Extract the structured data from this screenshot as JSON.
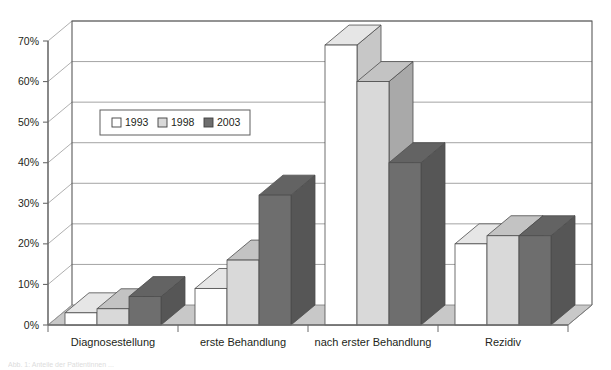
{
  "chart_data": {
    "type": "bar",
    "title": "",
    "subtitle": "",
    "xlabel": "",
    "ylabel": "",
    "categories": [
      "Diagnosestellung",
      "erste Behandlung",
      "nach erster Behandlung",
      "Rezidiv"
    ],
    "series": [
      {
        "name": "1993",
        "color": "#ffffff",
        "values": [
          3,
          9,
          69,
          20
        ]
      },
      {
        "name": "1998",
        "color": "#d9d9d9",
        "values": [
          4,
          16,
          60,
          22
        ]
      },
      {
        "name": "2003",
        "color": "#6e6e6e",
        "values": [
          7,
          32,
          40,
          22
        ]
      }
    ],
    "ylim": [
      0,
      70
    ],
    "ytick_values": [
      0,
      10,
      20,
      30,
      40,
      50,
      60,
      70
    ],
    "ytick_labels": [
      "0%",
      "10%",
      "20%",
      "30%",
      "40%",
      "50%",
      "60%",
      "70%"
    ],
    "grid": true,
    "grid_axis": "y",
    "legend": {
      "position": "upper-left-inside",
      "entries": [
        {
          "label": "1993",
          "swatch": "#ffffff"
        },
        {
          "label": "1998",
          "swatch": "#d9d9d9"
        },
        {
          "label": "2003",
          "swatch": "#6e6e6e"
        }
      ]
    },
    "style": {
      "three_d": true,
      "palette": "grayscale",
      "plot_background": "#ffffff",
      "floor_color": "#c8c8c8",
      "axis_color": "#6b6b6b",
      "gridline_color": "#9a9a9a",
      "bar_outline": "#4d4d4d"
    }
  },
  "caption": {
    "text": "Abb. 1: Anteile der Patientinnen ..."
  }
}
